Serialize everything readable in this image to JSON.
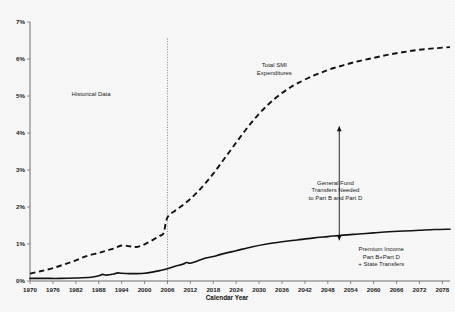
{
  "chart_data": {
    "type": "line",
    "title": "",
    "xlabel": "Calendar Year",
    "ylabel": "",
    "xlim": [
      1970,
      2080
    ],
    "ylim": [
      0,
      7
    ],
    "grid": false,
    "legend_position": "inline-annotations",
    "xticks": [
      1970,
      1976,
      1982,
      1988,
      1994,
      2000,
      2006,
      2012,
      2018,
      2024,
      2030,
      2036,
      2042,
      2048,
      2054,
      2060,
      2066,
      2072,
      2078
    ],
    "xtick_labels": [
      "1970",
      "1976",
      "1982",
      "1988",
      "1994",
      "2000",
      "2006",
      "2012",
      "2018",
      "2024",
      "2030",
      "2036",
      "2042",
      "2048",
      "2054",
      "2060",
      "2066",
      "2072",
      "2078"
    ],
    "yticks": [
      0,
      1,
      2,
      3,
      4,
      5,
      6,
      7
    ],
    "ytick_labels": [
      "0%",
      "1%",
      "2%",
      "3%",
      "4%",
      "5%",
      "6%",
      "7%"
    ],
    "series": [
      {
        "name": "Total SMI Expenditures",
        "style": "dashed",
        "x": [
          1970,
          1973,
          1976,
          1979,
          1982,
          1985,
          1988,
          1990,
          1992,
          1994,
          1996,
          1998,
          2000,
          2002,
          2004,
          2005,
          2006,
          2008,
          2010,
          2012,
          2014,
          2016,
          2018,
          2020,
          2022,
          2024,
          2026,
          2028,
          2030,
          2032,
          2034,
          2036,
          2038,
          2040,
          2044,
          2048,
          2052,
          2056,
          2060,
          2064,
          2068,
          2072,
          2076,
          2080
        ],
        "values": [
          0.2,
          0.27,
          0.35,
          0.45,
          0.56,
          0.68,
          0.76,
          0.82,
          0.88,
          0.96,
          0.94,
          0.92,
          0.99,
          1.1,
          1.22,
          1.3,
          1.72,
          1.9,
          2.05,
          2.22,
          2.42,
          2.65,
          2.9,
          3.18,
          3.46,
          3.74,
          4.02,
          4.28,
          4.52,
          4.73,
          4.92,
          5.08,
          5.22,
          5.34,
          5.54,
          5.7,
          5.83,
          5.94,
          6.03,
          6.12,
          6.19,
          6.25,
          6.29,
          6.32
        ]
      },
      {
        "name": "Premium Income Part B+Part D + State Transfers",
        "style": "solid",
        "x": [
          1970,
          1974,
          1978,
          1982,
          1986,
          1988,
          1989,
          1990,
          1992,
          1993,
          1994,
          1996,
          1998,
          2000,
          2002,
          2004,
          2006,
          2008,
          2010,
          2011,
          2012,
          2014,
          2016,
          2018,
          2020,
          2024,
          2028,
          2032,
          2036,
          2040,
          2044,
          2048,
          2052,
          2056,
          2060,
          2064,
          2068,
          2072,
          2076,
          2080
        ],
        "values": [
          0.07,
          0.07,
          0.07,
          0.08,
          0.1,
          0.14,
          0.18,
          0.16,
          0.19,
          0.22,
          0.21,
          0.2,
          0.2,
          0.21,
          0.24,
          0.28,
          0.33,
          0.4,
          0.45,
          0.5,
          0.48,
          0.55,
          0.62,
          0.66,
          0.72,
          0.82,
          0.92,
          1.0,
          1.06,
          1.11,
          1.16,
          1.2,
          1.24,
          1.27,
          1.3,
          1.33,
          1.35,
          1.37,
          1.39,
          1.4
        ]
      }
    ],
    "annotations": [
      {
        "id": "historical-data",
        "text": "Historical Data",
        "x": 1986,
        "y": 5.0
      },
      {
        "id": "total-smi",
        "lines": [
          "Total SMI",
          "Expenditures"
        ],
        "x": 2034,
        "y": 5.78
      },
      {
        "id": "general-fund",
        "lines": [
          "General Fund",
          "Transfers Needed",
          "to Part B and Part D"
        ],
        "x": 2050,
        "y": 2.6
      },
      {
        "id": "premium-income",
        "lines": [
          "Premium Income",
          "Part B+Part D",
          "+ State Transfers"
        ],
        "x": 2062,
        "y": 0.8
      }
    ],
    "divider_line": {
      "id": "projection-divider",
      "x": 2006,
      "y_top": 6.55,
      "y_bottom": 0
    },
    "gap_arrow": {
      "id": "general-fund-gap-arrow",
      "x": 2051,
      "y_top": 4.18,
      "y_bottom": 1.1,
      "double_headed": true
    }
  },
  "colors": {
    "background": "#f7f7f7",
    "ink": "#111111",
    "axis": "#6f6f6f"
  }
}
